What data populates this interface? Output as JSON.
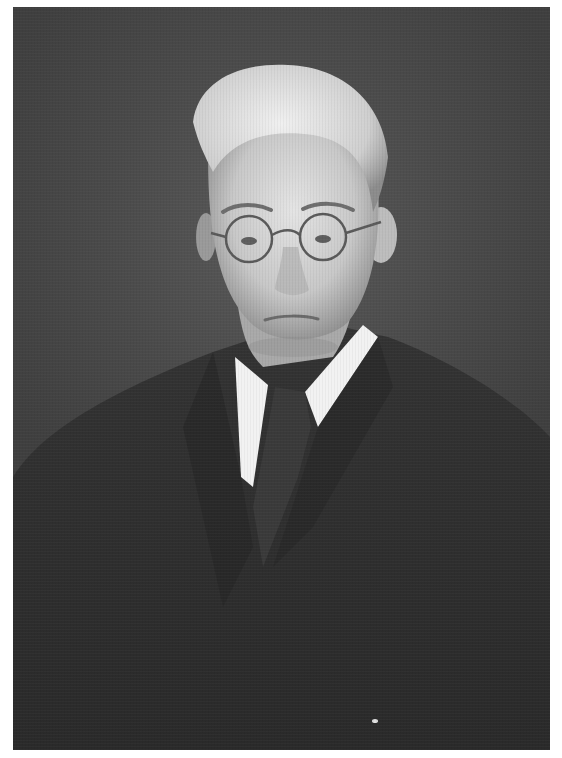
{
  "image": {
    "kind": "portrait-photograph",
    "color_mode": "black-and-white",
    "subject": {
      "description": "Older man with light wavy hair, round wire-rimmed eyeglasses, white shirt collar, dark tie and dark suit jacket",
      "pose": "head-and-shoulders, facing camera, slightly turned"
    },
    "background": "dark grey mottled studio backdrop",
    "border": "white margin",
    "colors": {
      "page_background": "#ffffff",
      "backdrop": "#454545",
      "suit": "#2e2e2e",
      "skin": "#d8d8d8",
      "hair": "#e6e6e6",
      "collar": "#f2f2f2",
      "tie": "#3a3a3a"
    }
  }
}
